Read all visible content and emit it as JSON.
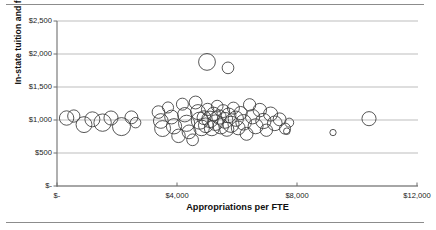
{
  "chart_data": {
    "type": "scatter",
    "variant": "bubble",
    "title": "",
    "xlabel": "Appropriations per FTE",
    "ylabel": "In-state tuition and fees",
    "xlim": [
      0,
      12000
    ],
    "ylim": [
      0,
      2500
    ],
    "xticks": [
      0,
      4000,
      8000,
      12000
    ],
    "xtick_labels": [
      "$-",
      "$4,000",
      "$8,000",
      "$12,000"
    ],
    "yticks": [
      0,
      500,
      1000,
      1500,
      2000,
      2500
    ],
    "ytick_labels": [
      "$-",
      "$500",
      "$1,000",
      "$1,500",
      "$2,000",
      "$2,500"
    ],
    "grid": "horizontal",
    "legend": "none",
    "series_color": "#3a3a3a",
    "marker_fill": "none",
    "points": [
      {
        "x": 320,
        "y": 1030,
        "r": 240
      },
      {
        "x": 560,
        "y": 1060,
        "r": 205
      },
      {
        "x": 900,
        "y": 930,
        "r": 265
      },
      {
        "x": 1180,
        "y": 1010,
        "r": 250
      },
      {
        "x": 1520,
        "y": 960,
        "r": 290
      },
      {
        "x": 1800,
        "y": 1030,
        "r": 235
      },
      {
        "x": 2150,
        "y": 900,
        "r": 300
      },
      {
        "x": 2480,
        "y": 1040,
        "r": 215
      },
      {
        "x": 2620,
        "y": 960,
        "r": 175
      },
      {
        "x": 3380,
        "y": 1120,
        "r": 210
      },
      {
        "x": 3460,
        "y": 985,
        "r": 245
      },
      {
        "x": 3520,
        "y": 870,
        "r": 265
      },
      {
        "x": 3700,
        "y": 1190,
        "r": 185
      },
      {
        "x": 3820,
        "y": 1045,
        "r": 230
      },
      {
        "x": 3900,
        "y": 905,
        "r": 255
      },
      {
        "x": 4050,
        "y": 760,
        "r": 225
      },
      {
        "x": 4180,
        "y": 1240,
        "r": 200
      },
      {
        "x": 4260,
        "y": 1080,
        "r": 240
      },
      {
        "x": 4320,
        "y": 950,
        "r": 270
      },
      {
        "x": 4400,
        "y": 820,
        "r": 230
      },
      {
        "x": 4520,
        "y": 700,
        "r": 195
      },
      {
        "x": 4620,
        "y": 1265,
        "r": 215
      },
      {
        "x": 4700,
        "y": 1120,
        "r": 250
      },
      {
        "x": 4760,
        "y": 990,
        "r": 285
      },
      {
        "x": 4820,
        "y": 880,
        "r": 260
      },
      {
        "x": 4900,
        "y": 1035,
        "r": 230
      },
      {
        "x": 4960,
        "y": 920,
        "r": 245
      },
      {
        "x": 5020,
        "y": 1160,
        "r": 205
      },
      {
        "x": 5100,
        "y": 1010,
        "r": 275
      },
      {
        "x": 5160,
        "y": 875,
        "r": 250
      },
      {
        "x": 5220,
        "y": 1090,
        "r": 230
      },
      {
        "x": 5280,
        "y": 960,
        "r": 260
      },
      {
        "x": 5340,
        "y": 1210,
        "r": 195
      },
      {
        "x": 5400,
        "y": 1045,
        "r": 240
      },
      {
        "x": 5460,
        "y": 905,
        "r": 255
      },
      {
        "x": 5540,
        "y": 1135,
        "r": 215
      },
      {
        "x": 5600,
        "y": 995,
        "r": 265
      },
      {
        "x": 5660,
        "y": 860,
        "r": 235
      },
      {
        "x": 5720,
        "y": 1070,
        "r": 245
      },
      {
        "x": 5800,
        "y": 935,
        "r": 270
      },
      {
        "x": 5880,
        "y": 1180,
        "r": 200
      },
      {
        "x": 5960,
        "y": 1020,
        "r": 255
      },
      {
        "x": 6040,
        "y": 880,
        "r": 230
      },
      {
        "x": 6120,
        "y": 1105,
        "r": 220
      },
      {
        "x": 6220,
        "y": 965,
        "r": 260
      },
      {
        "x": 6320,
        "y": 790,
        "r": 215
      },
      {
        "x": 6420,
        "y": 1230,
        "r": 205
      },
      {
        "x": 6520,
        "y": 1050,
        "r": 240
      },
      {
        "x": 6620,
        "y": 905,
        "r": 250
      },
      {
        "x": 6760,
        "y": 1150,
        "r": 225
      },
      {
        "x": 6880,
        "y": 985,
        "r": 255
      },
      {
        "x": 6980,
        "y": 845,
        "r": 205
      },
      {
        "x": 7120,
        "y": 1090,
        "r": 235
      },
      {
        "x": 7260,
        "y": 950,
        "r": 245
      },
      {
        "x": 7420,
        "y": 1010,
        "r": 215
      },
      {
        "x": 7600,
        "y": 870,
        "r": 185
      },
      {
        "x": 7740,
        "y": 960,
        "r": 150
      },
      {
        "x": 5000,
        "y": 1880,
        "r": 280
      },
      {
        "x": 5700,
        "y": 1790,
        "r": 195
      },
      {
        "x": 7660,
        "y": 830,
        "r": 110
      },
      {
        "x": 9200,
        "y": 810,
        "r": 105
      },
      {
        "x": 10400,
        "y": 1020,
        "r": 235
      }
    ]
  }
}
